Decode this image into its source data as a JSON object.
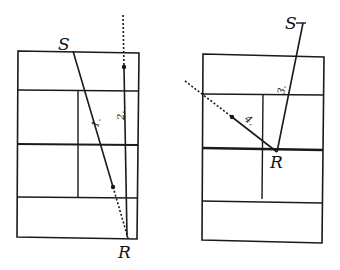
{
  "figure": {
    "colors": {
      "line": "#1a1a1a",
      "background": "#ffffff"
    }
  },
  "left_court": {
    "server_label": "S",
    "receiver_label": "R",
    "trajectories": [
      {
        "id": "1",
        "label": "1."
      },
      {
        "id": "2",
        "label": "2."
      }
    ]
  },
  "right_court": {
    "server_label": "S",
    "receiver_label": "R",
    "trajectories": [
      {
        "id": "3",
        "label": "3."
      },
      {
        "id": "4",
        "label": "4."
      }
    ]
  }
}
